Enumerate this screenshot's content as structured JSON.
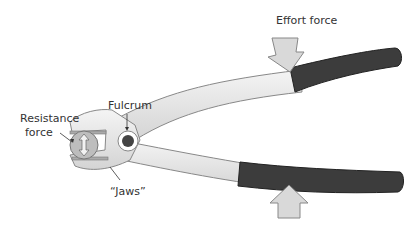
{
  "diagram": {
    "labels": {
      "effort": "Effort force",
      "fulcrum": "Fulcrum",
      "resistance_line1": "Resistance",
      "resistance_line2": "force",
      "jaws": "“Jaws”"
    },
    "colors": {
      "handle_grip": "#3c3c3c",
      "metal": "#e6e6e6",
      "outline": "#777777",
      "arrow_fill": "#d9d9d9",
      "fulcrum_dot": "#444444"
    }
  }
}
